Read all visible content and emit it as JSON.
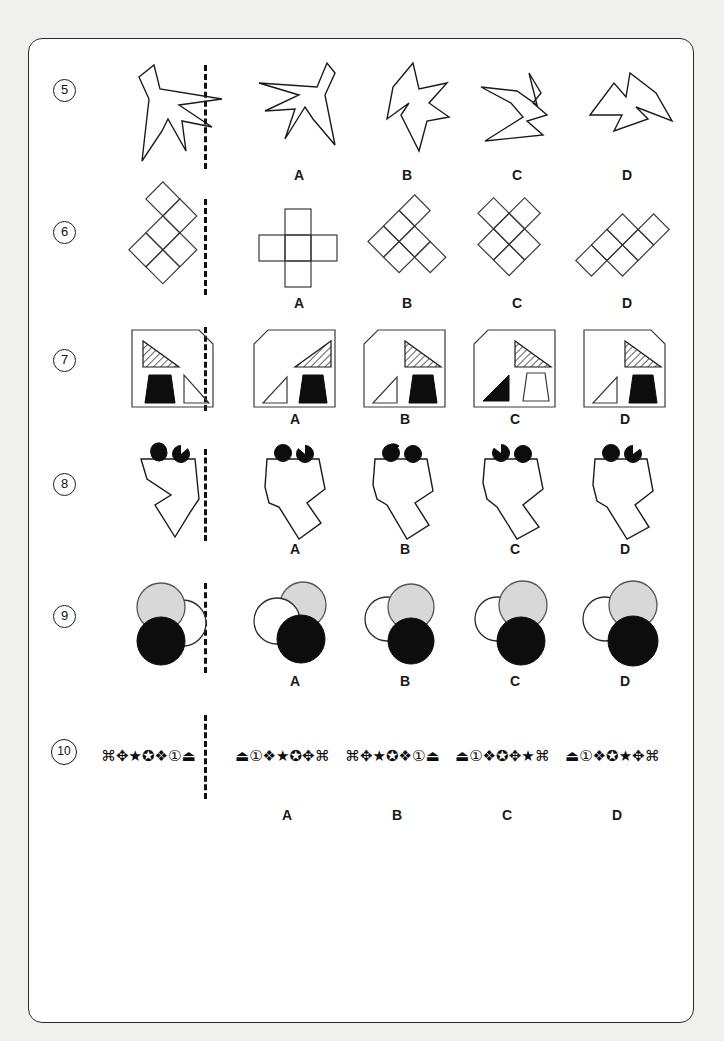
{
  "page": {
    "background_color": "#f0f0ee",
    "sheet_color": "#ffffff",
    "border_color": "#2b2b2b",
    "type": "visual-reasoning-worksheet"
  },
  "option_labels": [
    "A",
    "B",
    "C",
    "D"
  ],
  "questions": [
    {
      "number": "5",
      "prompt_shape": "irregular-arrow-polygon",
      "options": [
        {
          "label": "A",
          "shape": "irregular-arrow-polygon-rotated"
        },
        {
          "label": "B",
          "shape": "irregular-arrow-polygon-rotated"
        },
        {
          "label": "C",
          "shape": "irregular-arrow-polygon-rotated"
        },
        {
          "label": "D",
          "shape": "irregular-arrow-polygon-rotated"
        }
      ]
    },
    {
      "number": "6",
      "prompt_shape": "diamond-grid-cross",
      "options": [
        {
          "label": "A",
          "shape": "square-grid-cross"
        },
        {
          "label": "B",
          "shape": "diamond-grid-cross"
        },
        {
          "label": "C",
          "shape": "diamond-grid-cross"
        },
        {
          "label": "D",
          "shape": "diamond-grid-cross"
        }
      ]
    },
    {
      "number": "7",
      "prompt_shape": "box-with-hatched-triangle-black-trapezoid-white-triangle",
      "options": [
        {
          "label": "A",
          "shape": "box-corner-topleft"
        },
        {
          "label": "B",
          "shape": "box-corner-topleft"
        },
        {
          "label": "C",
          "shape": "box-corner-topleft"
        },
        {
          "label": "D",
          "shape": "box-corner-topright"
        }
      ]
    },
    {
      "number": "8",
      "prompt_shape": "zigzag-polygon-two-black-dots",
      "options": [
        {
          "label": "A",
          "shape": "zigzag-polygon-two-black-dots"
        },
        {
          "label": "B",
          "shape": "zigzag-polygon-two-black-dots"
        },
        {
          "label": "C",
          "shape": "zigzag-polygon-two-black-dots"
        },
        {
          "label": "D",
          "shape": "zigzag-polygon-two-black-dots"
        }
      ]
    },
    {
      "number": "9",
      "prompt_shape": "three-overlapping-circles-grey-white-black",
      "options": [
        {
          "label": "A",
          "shape": "three-overlapping-circles"
        },
        {
          "label": "B",
          "shape": "three-overlapping-circles"
        },
        {
          "label": "C",
          "shape": "three-overlapping-circles"
        },
        {
          "label": "D",
          "shape": "three-overlapping-circles"
        }
      ]
    },
    {
      "number": "10",
      "prompt_symbols": "⌘✥★✪❖①⏏",
      "options": [
        {
          "label": "A",
          "symbols": "⏏①❖★✪✥⌘"
        },
        {
          "label": "B",
          "symbols": "⌘✥★✪❖①⏏"
        },
        {
          "label": "C",
          "symbols": "⏏①❖✪✥★⌘"
        },
        {
          "label": "D",
          "symbols": "⏏①❖✪★✥⌘"
        }
      ]
    }
  ],
  "colors": {
    "ink": "#1a1a1a",
    "black_fill": "#0d0d0d",
    "grey_fill": "#d8d8d8",
    "white_fill": "#ffffff"
  }
}
